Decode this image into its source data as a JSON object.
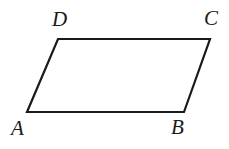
{
  "figure": {
    "kind": "parallelogram",
    "name": "parallelogram-ABCD",
    "background_color": "#ffffff",
    "stroke_color": "#1a1a1a",
    "stroke_width": 2.2,
    "width": 229,
    "height": 149,
    "vertices": [
      {
        "id": "A",
        "label": "A",
        "x": 27,
        "y": 112,
        "label_x": 11,
        "label_y": 118
      },
      {
        "id": "B",
        "label": "B",
        "x": 184,
        "y": 112,
        "label_x": 171,
        "label_y": 117
      },
      {
        "id": "C",
        "label": "C",
        "x": 210,
        "y": 39,
        "label_x": 204,
        "label_y": 8
      },
      {
        "id": "D",
        "label": "D",
        "x": 58,
        "y": 39,
        "label_x": 52,
        "label_y": 9
      }
    ],
    "edges": [
      {
        "id": "AB",
        "from": "A",
        "to": "B",
        "name": "edge-ab-bottom"
      },
      {
        "id": "BC",
        "from": "B",
        "to": "C",
        "name": "edge-bc-right"
      },
      {
        "id": "CD",
        "from": "C",
        "to": "D",
        "name": "edge-cd-top"
      },
      {
        "id": "DA",
        "from": "D",
        "to": "A",
        "name": "edge-da-left"
      }
    ],
    "path_points": "27,112 184,112 210,39 58,39",
    "labels": {
      "A": "A",
      "B": "B",
      "C": "C",
      "D": "D"
    }
  }
}
